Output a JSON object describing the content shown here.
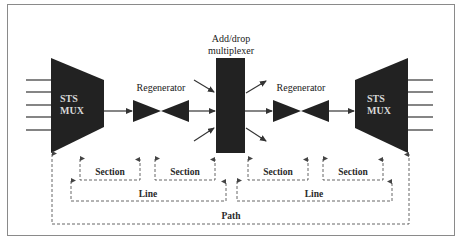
{
  "figure": {
    "frame_color": "#8a8a8a",
    "block_color": "#222222",
    "dashed_color": "#555555"
  },
  "components": {
    "left_mux": {
      "line1": "STS",
      "line2": "MUX",
      "input_count": 5
    },
    "regenerator_1": {
      "label": "Regenerator"
    },
    "add_drop_multiplexer": {
      "line1": "Add/drop",
      "line2": "multiplexer"
    },
    "regenerator_2": {
      "label": "Regenerator"
    },
    "right_mux": {
      "line1": "STS",
      "line2": "MUX",
      "output_count": 5
    }
  },
  "spans": {
    "sections": [
      {
        "label": "Section"
      },
      {
        "label": "Section"
      },
      {
        "label": "Section"
      },
      {
        "label": "Section"
      }
    ],
    "lines": [
      {
        "label": "Line"
      },
      {
        "label": "Line"
      }
    ],
    "path": {
      "label": "Path"
    }
  }
}
